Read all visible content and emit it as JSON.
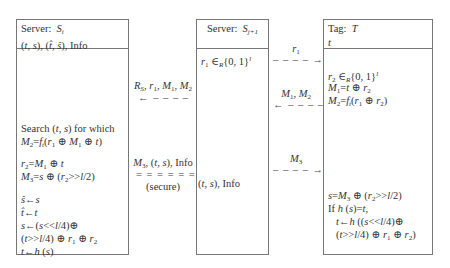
{
  "parties": {
    "server_i": {
      "header_line1": "Server: S_i",
      "header_line2": "(t, s), (t̂, ŝ), Info",
      "lines": [
        "Search (t, s) for which",
        "M₂=f_t(r₁ ⊕ M₁ ⊕ t)",
        "r₂=M₁ ⊕ t",
        "M₃=s ⊕ (r₂>>l/2)",
        "ŝ←s",
        "t̂←t",
        "s←(s<<l/4)⊕",
        "(t>>l/4) ⊕ r₁ ⊕ r₂",
        "t←h (s)"
      ]
    },
    "server_j1": {
      "header_line1": "Server: S_j+1",
      "lines": [
        "r₁ ∈R{0, 1}^l",
        "(t, s), Info"
      ]
    },
    "tag": {
      "header_line1": "Tag: T",
      "header_line2": "t",
      "lines": [
        "r₂ ∈R{0, 1}^l",
        "M₁=t ⊕ r₂",
        "M₂=f_t(r₁ ⊕ r₂)",
        "s=M₃ ⊕ (r₂>>l/2)",
        "If h (s)=t,",
        "t←h ((s<<l/4)⊕",
        "(t>>l/4) ⊕ r₁ ⊕ r₂)"
      ]
    }
  },
  "messages": [
    {
      "label": "R_S, r₁, M₁, M₂",
      "direction": "left",
      "style": "dashed",
      "from": "S_j+1",
      "to": "S_i"
    },
    {
      "label": "M₃, (t, s), Info",
      "note": "(secure)",
      "direction": "right",
      "style": "double",
      "from": "S_i",
      "to": "S_j+1"
    },
    {
      "label": "r₁",
      "direction": "right",
      "style": "dashed",
      "from": "S_j+1",
      "to": "T"
    },
    {
      "label": "M₁, M₂",
      "direction": "left",
      "style": "dashed",
      "from": "T",
      "to": "S_j+1"
    },
    {
      "label": "M₃",
      "direction": "right",
      "style": "dashed",
      "from": "S_j+1",
      "to": "T"
    }
  ],
  "arrows": {
    "dashed_left": "←– – – – –",
    "dashed_right": "– – – – –→",
    "double_right": "= = = = = =⇒"
  }
}
